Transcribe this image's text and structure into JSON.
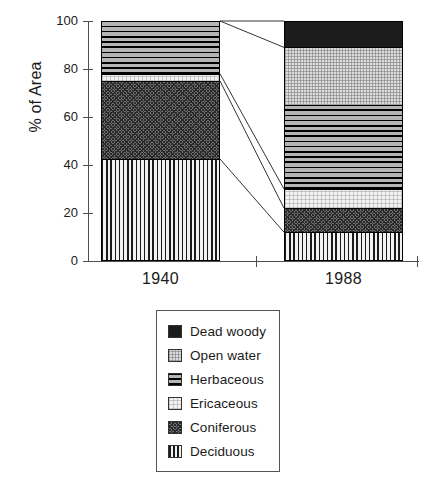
{
  "chart_data": {
    "type": "bar",
    "subtype": "stacked-bar",
    "title": "",
    "xlabel": "",
    "ylabel": "% of Area",
    "ylim": [
      0,
      100
    ],
    "yticks": [
      0,
      20,
      40,
      60,
      80,
      100
    ],
    "ytick_labels": [
      "0",
      "20",
      "40",
      "60",
      "80",
      "100"
    ],
    "categories": [
      "1940",
      "1988"
    ],
    "grid": false,
    "legend_position": "below-plot",
    "stack_order_bottom_to_top": [
      "Deciduous",
      "Coniferous",
      "Ericaceous",
      "Herbaceous",
      "Open water",
      "Dead woody"
    ],
    "series": [
      {
        "name": "Deciduous",
        "values": [
          42.5,
          12.0
        ]
      },
      {
        "name": "Coniferous",
        "values": [
          32.5,
          10.0
        ]
      },
      {
        "name": "Ericaceous",
        "values": [
          3.0,
          8.0
        ]
      },
      {
        "name": "Herbaceous",
        "values": [
          22.0,
          35.0
        ]
      },
      {
        "name": "Open water",
        "values": [
          0.0,
          24.0
        ]
      },
      {
        "name": "Dead woody",
        "values": [
          0.0,
          11.0
        ]
      }
    ],
    "cumulative_tops": {
      "1940": {
        "Deciduous": 42.5,
        "Coniferous": 75.0,
        "Ericaceous": 78.0,
        "Herbaceous": 100.0,
        "Open water": 100.0,
        "Dead woody": 100.0
      },
      "1988": {
        "Deciduous": 12.0,
        "Coniferous": 22.0,
        "Ericaceous": 30.0,
        "Herbaceous": 65.0,
        "Open water": 89.0,
        "Dead woody": 100.0
      }
    },
    "connectors": [
      {
        "from_value": 100.0,
        "to_value": 100.0
      },
      {
        "from_value": 100.0,
        "to_value": 89.0
      },
      {
        "from_value": 78.0,
        "to_value": 30.0
      },
      {
        "from_value": 75.0,
        "to_value": 22.0
      },
      {
        "from_value": 42.5,
        "to_value": 12.0
      }
    ]
  },
  "axes": {
    "y_title": "% of Area",
    "y_ticks": [
      {
        "label": "100",
        "value": 100
      },
      {
        "label": "80",
        "value": 80
      },
      {
        "label": "60",
        "value": 60
      },
      {
        "label": "40",
        "value": 40
      },
      {
        "label": "20",
        "value": 20
      },
      {
        "label": "0",
        "value": 0
      }
    ],
    "x_labels": [
      {
        "label": "1940"
      },
      {
        "label": "1988"
      }
    ]
  },
  "legend": {
    "items": [
      {
        "label": "Dead woody",
        "pattern": "solid-black",
        "color": "#1c1c1c"
      },
      {
        "label": "Open water",
        "pattern": "light-stipple",
        "color": "#dcdcdc"
      },
      {
        "label": "Herbaceous",
        "pattern": "horizontal-lines",
        "color": "#9a9a9a"
      },
      {
        "label": "Ericaceous",
        "pattern": "very-light",
        "color": "#f2f2f2"
      },
      {
        "label": "Coniferous",
        "pattern": "cross-hatch",
        "color": "#6f6f6f"
      },
      {
        "label": "Deciduous",
        "pattern": "vertical-lines",
        "color": "#e8e8e8"
      }
    ]
  }
}
